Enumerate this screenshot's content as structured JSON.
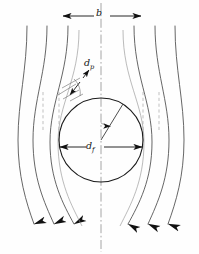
{
  "figure": {
    "kind": "flow-around-cylindrical-fiber-schematic",
    "title_text": "",
    "background_color": "#fefefe",
    "line_color": "#3a3a3a",
    "heavy_line_color": "#111111",
    "dashed_line_color": "#9a9a9a",
    "width_px": 199,
    "height_px": 254
  },
  "labels": {
    "capture_width": {
      "symbol": "b",
      "sub": "",
      "text": "b"
    },
    "particle_diameter": {
      "symbol": "d",
      "sub": "p",
      "text": "dp"
    },
    "fiber_diameter": {
      "symbol": "d",
      "sub": "f",
      "text": "df"
    }
  },
  "dimensions": {
    "b_arrow": {
      "x1": 62,
      "x2": 142,
      "y": 16,
      "label": "b"
    },
    "df_arrow": {
      "x1": 59,
      "x2": 143,
      "y": 147,
      "label": "df"
    },
    "dp_arrow": {
      "x1": 89,
      "y1": 70,
      "x2": 68,
      "y2": 94,
      "label": "dp"
    }
  },
  "fiber": {
    "center_x": 101,
    "center_y": 140,
    "radius": 42,
    "radius_line_angle_deg": 58,
    "angle_arc_radius": 17
  },
  "centerline": {
    "x": 101,
    "y1": 2,
    "y2": 252,
    "style": "dash-dot"
  },
  "streamlines": {
    "count": 6,
    "direction": "downward",
    "arrowheads": 6,
    "note": "streamlines deflect around the circular fiber cross-section"
  },
  "icon_names": {
    "arrow_left": "arrow-left-icon",
    "arrow_right": "arrow-right-icon",
    "arrow_down": "arrow-down-icon",
    "circle": "fiber-circle-icon"
  }
}
